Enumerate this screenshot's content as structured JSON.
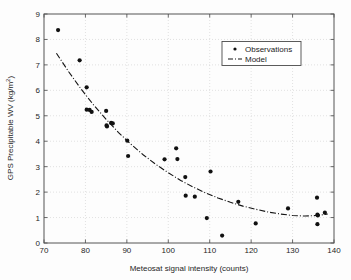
{
  "figure": {
    "background_color": "#fdfdfd",
    "frame_color": "#555555",
    "marker_color": "#111111",
    "grid_color": "#cfcfcf"
  },
  "axis": {
    "x_title": "Meteosat signal intensity (counts)",
    "y_title": "GPS Precipitable WV (kg/m",
    "y_title_exponent": "2",
    "y_title_close": ")",
    "x_ticks": [
      "70",
      "80",
      "90",
      "100",
      "110",
      "120",
      "130",
      "140"
    ],
    "y_ticks": [
      "0",
      "1",
      "2",
      "3",
      "4",
      "5",
      "6",
      "7",
      "8",
      "9"
    ]
  },
  "legend": {
    "entries": [
      {
        "label": "Observations",
        "marker": "dot-marker"
      },
      {
        "label": "Model",
        "marker": "dashdot-line"
      }
    ]
  },
  "chart_data": {
    "type": "scatter",
    "title": "",
    "xlabel": "Meteosat signal intensity (counts)",
    "ylabel": "GPS Precipitable WV (kg/m^2)",
    "xlim": [
      70,
      140
    ],
    "ylim": [
      0,
      9
    ],
    "xticks": [
      70,
      80,
      90,
      100,
      110,
      120,
      130,
      140
    ],
    "yticks": [
      0,
      1,
      2,
      3,
      4,
      5,
      6,
      7,
      8,
      9
    ],
    "grid": true,
    "legend_position": "upper right",
    "series": [
      {
        "name": "Observations",
        "type": "scatter",
        "marker": "filled-circle",
        "color": "#111111",
        "points": [
          [
            73.4,
            8.37
          ],
          [
            78.6,
            7.18
          ],
          [
            80.3,
            6.12
          ],
          [
            80.3,
            5.24
          ],
          [
            81.0,
            5.23
          ],
          [
            81.5,
            5.15
          ],
          [
            85.0,
            5.19
          ],
          [
            85.1,
            4.62
          ],
          [
            85.2,
            4.58
          ],
          [
            86.2,
            4.72
          ],
          [
            86.6,
            4.7
          ],
          [
            90.1,
            4.02
          ],
          [
            90.3,
            3.42
          ],
          [
            99.1,
            3.29
          ],
          [
            101.9,
            3.72
          ],
          [
            102.2,
            3.3
          ],
          [
            104.1,
            2.59
          ],
          [
            104.2,
            1.86
          ],
          [
            106.4,
            1.82
          ],
          [
            109.3,
            0.98
          ],
          [
            110.2,
            2.81
          ],
          [
            113.0,
            0.29
          ],
          [
            116.9,
            1.62
          ],
          [
            121.1,
            0.77
          ],
          [
            128.9,
            1.36
          ],
          [
            135.9,
            1.78
          ],
          [
            136.0,
            1.12
          ],
          [
            136.1,
            1.08
          ],
          [
            136.0,
            0.74
          ],
          [
            137.8,
            1.19
          ]
        ]
      },
      {
        "name": "Model",
        "type": "line",
        "linestyle": "dashdot",
        "color": "#141414",
        "points": [
          [
            73.0,
            7.46
          ],
          [
            76.0,
            6.72
          ],
          [
            79.0,
            6.04
          ],
          [
            82.0,
            5.42
          ],
          [
            85.0,
            4.86
          ],
          [
            88.0,
            4.34
          ],
          [
            91.0,
            3.88
          ],
          [
            94.0,
            3.46
          ],
          [
            97.0,
            3.09
          ],
          [
            100.0,
            2.76
          ],
          [
            103.0,
            2.46
          ],
          [
            106.0,
            2.2
          ],
          [
            109.0,
            1.97
          ],
          [
            112.0,
            1.77
          ],
          [
            115.0,
            1.6
          ],
          [
            118.0,
            1.45
          ],
          [
            121.0,
            1.33
          ],
          [
            124.0,
            1.22
          ],
          [
            127.0,
            1.14
          ],
          [
            130.0,
            1.08
          ],
          [
            133.0,
            1.06
          ],
          [
            136.0,
            1.08
          ],
          [
            138.5,
            1.14
          ]
        ]
      }
    ]
  }
}
